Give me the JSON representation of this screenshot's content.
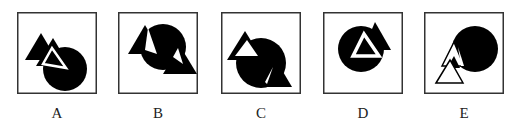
{
  "options": [
    {
      "label": "A"
    },
    {
      "label": "B"
    },
    {
      "label": "C"
    },
    {
      "label": "D"
    },
    {
      "label": "E"
    }
  ],
  "colors": {
    "ink": "#000000",
    "frame": "#333333",
    "background": "#ffffff"
  }
}
